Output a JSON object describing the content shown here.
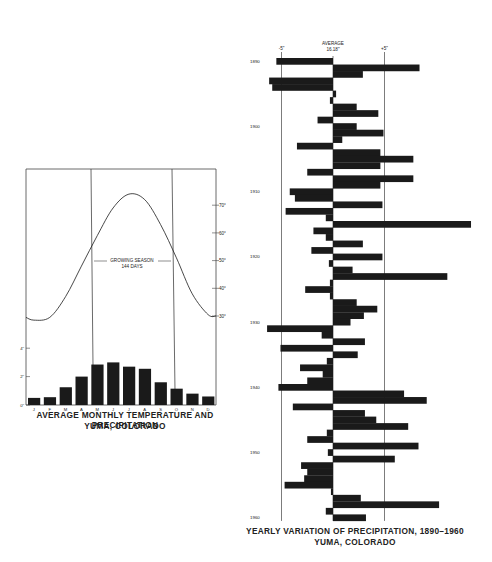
{
  "chart_data": [
    {
      "type": "bar+line",
      "title": "AVERAGE MONTHLY TEMPERATURE AND PRECIPITATION",
      "subtitle": "YUMA, COLORADO",
      "categories": [
        "J",
        "F",
        "M",
        "A",
        "M",
        "J",
        "J",
        "A",
        "S",
        "O",
        "N",
        "D"
      ],
      "series": [
        {
          "name": "Precipitation (inches)",
          "type": "bar",
          "values": [
            0.5,
            0.55,
            1.25,
            2.0,
            2.85,
            3.0,
            2.7,
            2.55,
            1.6,
            1.15,
            0.8,
            0.6
          ]
        },
        {
          "name": "Temperature (°F)",
          "type": "line",
          "values": [
            28.5,
            29.5,
            37,
            48,
            59,
            69,
            74,
            72,
            63,
            51,
            38,
            30.5
          ]
        }
      ],
      "left_axis": {
        "label": "precipitation",
        "ticks": [
          "0\"",
          "2\"",
          "4\""
        ],
        "range": [
          0,
          4
        ]
      },
      "right_axis": {
        "label": "temperature",
        "ticks": [
          "30°",
          "40°",
          "50°",
          "60°",
          "70°"
        ],
        "range": [
          30,
          70
        ]
      },
      "annotation": {
        "line1": "GROWING SEASON",
        "line2": "144 DAYS"
      }
    },
    {
      "type": "bar",
      "orientation": "horizontal",
      "title": "YEARLY VARIATION OF PRECIPITATION, 1890-1960",
      "subtitle": "YUMA, COLORADO",
      "average_label": "AVERAGE",
      "average_value": "16.18\"",
      "reference_lines": [
        "-5\"",
        "+5\""
      ],
      "year_ticks": [
        "1890",
        "1900",
        "1910",
        "1920",
        "1930",
        "1940",
        "1950",
        "1960"
      ],
      "years": [
        1890,
        1891,
        1892,
        1893,
        1894,
        1895,
        1896,
        1897,
        1898,
        1899,
        1900,
        1901,
        1902,
        1903,
        1904,
        1905,
        1906,
        1907,
        1908,
        1909,
        1910,
        1911,
        1912,
        1913,
        1914,
        1915,
        1916,
        1917,
        1918,
        1919,
        1920,
        1921,
        1922,
        1923,
        1924,
        1925,
        1926,
        1927,
        1928,
        1929,
        1930,
        1931,
        1932,
        1933,
        1934,
        1935,
        1936,
        1937,
        1938,
        1939,
        1940,
        1941,
        1942,
        1943,
        1944,
        1945,
        1946,
        1947,
        1948,
        1949,
        1950,
        1951,
        1952,
        1953,
        1954,
        1955,
        1956,
        1957,
        1958,
        1959,
        1960
      ],
      "values": [
        -5.5,
        8.4,
        2.9,
        -6.2,
        -5.9,
        0.3,
        -0.3,
        2.3,
        4.4,
        -1.5,
        2.3,
        4.9,
        0.9,
        -3.5,
        4.6,
        7.8,
        4.6,
        -2.5,
        7.8,
        4.6,
        -4.2,
        -3.7,
        4.8,
        -4.6,
        -0.7,
        13.4,
        -1.9,
        -0.7,
        2.9,
        -2.1,
        4.8,
        -0.4,
        1.9,
        11.1,
        -0.3,
        -2.7,
        -0.3,
        2.3,
        4.3,
        3.0,
        1.7,
        -6.4,
        -1.1,
        3.1,
        -5.1,
        2.4,
        -0.6,
        -3.2,
        -1.0,
        -2.5,
        -5.3,
        6.9,
        9.1,
        -3.9,
        3.1,
        4.2,
        7.3,
        -0.6,
        -2.5,
        8.3,
        -0.5,
        6.0,
        -3.1,
        -2.5,
        -2.8,
        -4.7,
        -0.2,
        2.7,
        10.3,
        -0.7,
        3.2
      ],
      "xlabel": "departure from average (inches)",
      "xlim": [
        -7,
        13.5
      ]
    }
  ],
  "left_chart": {
    "title": "AVERAGE MONTHLY TEMPERATURE AND PRECIPITATION",
    "subtitle": "YUMA, COLORADO",
    "growing_line1": "GROWING SEASON",
    "growing_line2": "144 DAYS"
  },
  "right_chart": {
    "title": "YEARLY VARIATION OF PRECIPITATION, 1890–1960",
    "subtitle": "YUMA, COLORADO",
    "avg_label": "AVERAGE",
    "avg_value": "16.18\""
  }
}
